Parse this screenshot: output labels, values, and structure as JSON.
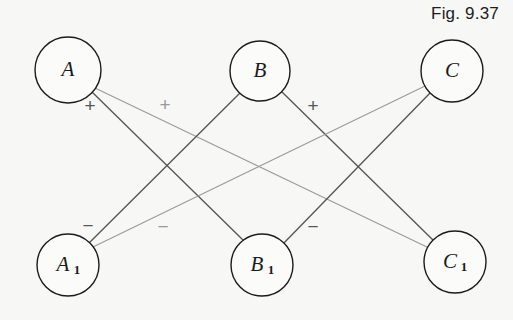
{
  "figure": {
    "caption": "Fig. 9.37",
    "background_color": "#f7f7f5",
    "edge_dark_color": "#565656",
    "edge_light_color": "#9a9a9a",
    "node_stroke_color": "#1b1b1b",
    "node_fill_color": "#fbfbfa",
    "label_color": "#1b1b1b"
  },
  "nodes": [
    {
      "id": "A",
      "label": "A",
      "sub": "",
      "cx": 68,
      "cy": 70,
      "r": 33
    },
    {
      "id": "B",
      "label": "B",
      "sub": "",
      "cx": 260,
      "cy": 71,
      "r": 30
    },
    {
      "id": "C",
      "label": "C",
      "sub": "",
      "cx": 452,
      "cy": 71,
      "r": 31
    },
    {
      "id": "A1",
      "label": "A",
      "sub": "1",
      "cx": 68,
      "cy": 265,
      "r": 31
    },
    {
      "id": "B1",
      "label": "B",
      "sub": "1",
      "cx": 262,
      "cy": 265,
      "r": 31
    },
    {
      "id": "C1",
      "label": "C",
      "sub": "1",
      "cx": 455,
      "cy": 262,
      "r": 31
    }
  ],
  "edges": [
    {
      "id": "A-B1",
      "from": "A",
      "to": "B1",
      "shade": "dark",
      "x1": 92,
      "y1": 92,
      "x2": 243,
      "y2": 240
    },
    {
      "id": "A-C1",
      "from": "A",
      "to": "C1",
      "shade": "light",
      "x1": 95,
      "y1": 88,
      "x2": 429,
      "y2": 248
    },
    {
      "id": "B-A1",
      "from": "B",
      "to": "A1",
      "shade": "dark",
      "x1": 240,
      "y1": 93,
      "x2": 87,
      "y2": 245
    },
    {
      "id": "B-C1",
      "from": "B",
      "to": "C1",
      "shade": "dark",
      "x1": 282,
      "y1": 92,
      "x2": 434,
      "y2": 241
    },
    {
      "id": "C-A1",
      "from": "C",
      "to": "A1",
      "shade": "light",
      "x1": 425,
      "y1": 86,
      "x2": 93,
      "y2": 247
    },
    {
      "id": "C-B1",
      "from": "C",
      "to": "B1",
      "shade": "dark",
      "x1": 430,
      "y1": 93,
      "x2": 283,
      "y2": 244
    }
  ],
  "signs": [
    {
      "id": "sign-plus-A",
      "text": "+",
      "x": 90,
      "y": 112,
      "shade": "dark"
    },
    {
      "id": "sign-plus-AC",
      "text": "+",
      "x": 165,
      "y": 111,
      "shade": "light"
    },
    {
      "id": "sign-plus-B",
      "text": "+",
      "x": 313,
      "y": 112,
      "shade": "dark"
    },
    {
      "id": "sign-minus-A",
      "text": "−",
      "x": 88,
      "y": 232,
      "shade": "dark"
    },
    {
      "id": "sign-minus-AC",
      "text": "−",
      "x": 163,
      "y": 233,
      "shade": "light"
    },
    {
      "id": "sign-minus-B",
      "text": "−",
      "x": 313,
      "y": 233,
      "shade": "dark"
    }
  ]
}
